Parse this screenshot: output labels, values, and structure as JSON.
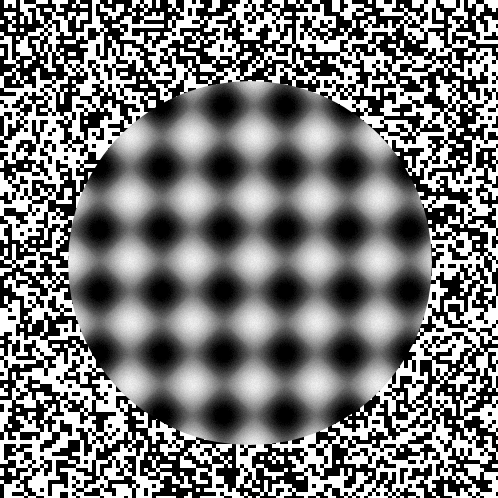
{
  "stimulus": {
    "width": 498,
    "height": 498,
    "background": {
      "type": "random-binary-noise",
      "cell_size_px": 4,
      "colors": [
        "#000000",
        "#ffffff"
      ],
      "seed": 7
    },
    "aperture": {
      "shape": "circle",
      "center_x": 250,
      "center_y": 263,
      "radius": 182
    },
    "plaid": {
      "type": "sinusoidal-plaid",
      "period_px": 62,
      "peak_origin_x": 254,
      "peak_origin_y": 260,
      "contrast": 1.0,
      "mean_luminance": 110,
      "amplitude": 125,
      "noise_jitter": 14
    }
  }
}
